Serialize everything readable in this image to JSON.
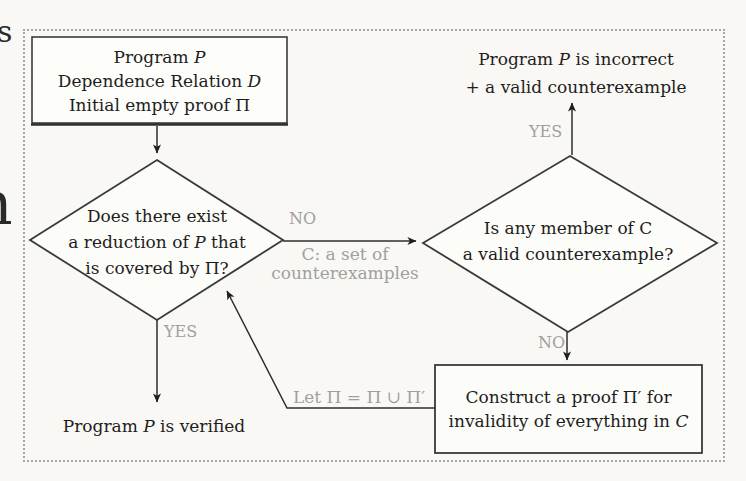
{
  "colors": {
    "paper": "#f9f8f4",
    "ink": "#1e1e1e",
    "line": "#2e2e2e",
    "muted_label": "#a0a0a0",
    "frame_dots": "#a6a6a6"
  },
  "nodes": {
    "start_box": {
      "lines": [
        [
          {
            "t": "Program "
          },
          {
            "t": "P",
            "i": true
          }
        ],
        [
          {
            "t": "Dependence Relation "
          },
          {
            "t": "D",
            "i": true
          }
        ],
        [
          {
            "t": "Initial empty proof Π"
          }
        ]
      ]
    },
    "reduction_diamond": {
      "lines": [
        [
          {
            "t": "Does there exist"
          }
        ],
        [
          {
            "t": "a reduction of "
          },
          {
            "t": "P",
            "i": true
          },
          {
            "t": " that"
          }
        ],
        [
          {
            "t": "is covered by Π?"
          }
        ]
      ]
    },
    "counterexample_diamond": {
      "lines": [
        [
          {
            "t": "Is any member of C"
          }
        ],
        [
          {
            "t": "a valid counterexample?"
          }
        ]
      ]
    },
    "construct_box": {
      "lines": [
        [
          {
            "t": "Construct a proof Π′ for"
          }
        ],
        [
          {
            "t": "invalidity of everything in "
          },
          {
            "t": "C",
            "i": true
          }
        ]
      ]
    },
    "incorrect_outcome": {
      "lines": [
        [
          {
            "t": "Program "
          },
          {
            "t": "P",
            "i": true
          },
          {
            "t": " is incorrect"
          }
        ],
        [
          {
            "t": "+ a valid counterexample"
          }
        ]
      ]
    },
    "verified_outcome": {
      "lines": [
        [
          {
            "t": "Program "
          },
          {
            "t": "P",
            "i": true
          },
          {
            "t": " is verified"
          }
        ]
      ]
    }
  },
  "edge_labels": {
    "no_to_counterexample_check": "NO",
    "c_set_note_line1": "C: a set of",
    "c_set_note_line2": "counterexamples",
    "yes_to_verified": "YES",
    "yes_to_incorrect": "YES",
    "no_to_construct": "NO",
    "proof_union_note": "Let Π = Π ∪ Π′"
  },
  "page_edge_fragments": {
    "top_left": "s",
    "mid_left": "n"
  }
}
